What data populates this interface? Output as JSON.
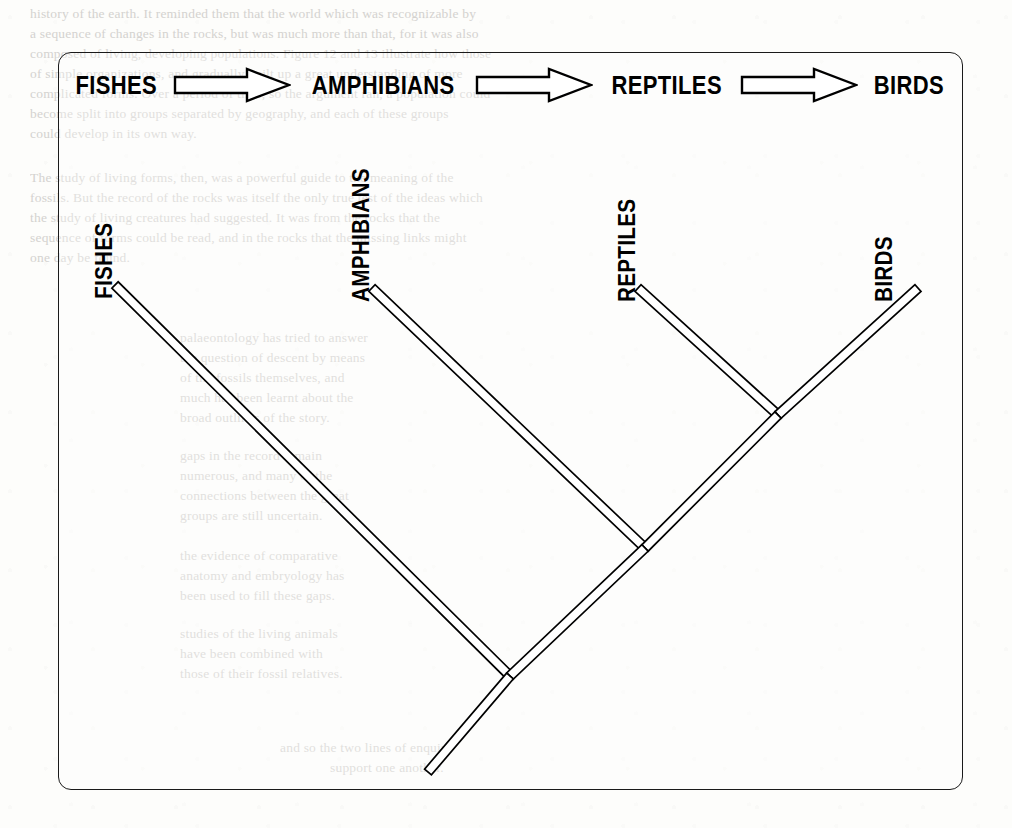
{
  "figure": {
    "type": "cladogram",
    "caption_visible": false,
    "border_color": "#1a1a1a",
    "ink_color": "#000000",
    "page_color": "#fdfdfb"
  },
  "sequence_row": {
    "items": [
      {
        "label": "FISHES",
        "kind": "text"
      },
      {
        "label": "arrow-right-1",
        "kind": "arrow"
      },
      {
        "label": "AMPHIBIANS",
        "kind": "text"
      },
      {
        "label": "arrow-right-2",
        "kind": "arrow"
      },
      {
        "label": "REPTILES",
        "kind": "text"
      },
      {
        "label": "arrow-right-3",
        "kind": "arrow"
      },
      {
        "label": "BIRDS",
        "kind": "text"
      }
    ]
  },
  "tree": {
    "tips": [
      {
        "name": "FISHES",
        "tip_x": 115,
        "tip_y": 285,
        "label_x": 118,
        "label_y": 272
      },
      {
        "name": "AMPHIBIANS",
        "tip_x": 372,
        "tip_y": 288,
        "label_x": 375,
        "label_y": 275
      },
      {
        "name": "REPTILES",
        "tip_x": 638,
        "tip_y": 288,
        "label_x": 641,
        "label_y": 275
      },
      {
        "name": "BIRDS",
        "tip_x": 918,
        "tip_y": 288,
        "label_x": 898,
        "label_y": 275
      }
    ],
    "nodes": [
      {
        "name": "reptiles-birds-node",
        "x": 778,
        "y": 415
      },
      {
        "name": "amphibians-node",
        "x": 645,
        "y": 548
      },
      {
        "name": "fishes-root-node",
        "x": 510,
        "y": 676
      },
      {
        "name": "root-stem-end",
        "x": 428,
        "y": 772
      }
    ],
    "branches": [
      {
        "name": "branch-fishes",
        "from": [
          115,
          285
        ],
        "to": [
          510,
          676
        ]
      },
      {
        "name": "branch-amphibians",
        "from": [
          372,
          288
        ],
        "to": [
          645,
          548
        ]
      },
      {
        "name": "branch-reptiles",
        "from": [
          638,
          288
        ],
        "to": [
          778,
          415
        ]
      },
      {
        "name": "branch-birds",
        "from": [
          918,
          288
        ],
        "to": [
          778,
          415
        ]
      },
      {
        "name": "branch-internal-upper",
        "from": [
          778,
          415
        ],
        "to": [
          645,
          548
        ]
      },
      {
        "name": "branch-internal-lower",
        "from": [
          645,
          548
        ],
        "to": [
          510,
          676
        ]
      },
      {
        "name": "branch-root-stem",
        "from": [
          510,
          676
        ],
        "to": [
          428,
          772
        ]
      }
    ],
    "branch_width": 9
  },
  "background_ghost_text": {
    "note": "faint show-through from reverse of scanned page",
    "lines": [
      {
        "x": 30,
        "y": 6,
        "text": "history of the earth. It reminded them that the world which was recognizable by"
      },
      {
        "x": 30,
        "y": 26,
        "text": "a sequence of changes in the rocks, but was much more than that, for it was also"
      },
      {
        "x": 30,
        "y": 46,
        "text": "composed of living, developing populations. Figure 12 and 13 illustrate how those"
      },
      {
        "x": 30,
        "y": 66,
        "text": "of simple organizations, and gradually built up a great understanding of more"
      },
      {
        "x": 30,
        "y": 86,
        "text": "complicated forms. Over a period of time, so the argument ran, a population could"
      },
      {
        "x": 30,
        "y": 106,
        "text": "become split into groups separated by geography, and each of these groups"
      },
      {
        "x": 30,
        "y": 126,
        "text": "could develop in its own way."
      },
      {
        "x": 30,
        "y": 170,
        "text": "The study of living forms, then, was a powerful guide to the meaning of the"
      },
      {
        "x": 30,
        "y": 190,
        "text": "fossils. But the record of the rocks was itself the only true test of the ideas which"
      },
      {
        "x": 30,
        "y": 210,
        "text": "the study of living creatures had suggested. It was from the rocks that the"
      },
      {
        "x": 30,
        "y": 230,
        "text": "sequence of forms could be read, and in the rocks that the missing links might"
      },
      {
        "x": 30,
        "y": 250,
        "text": "one day be found."
      },
      {
        "x": 180,
        "y": 330,
        "text": "palaeontology has tried to answer"
      },
      {
        "x": 180,
        "y": 350,
        "text": "the question of descent by means"
      },
      {
        "x": 180,
        "y": 370,
        "text": "of the fossils themselves, and"
      },
      {
        "x": 180,
        "y": 390,
        "text": "much has been learnt about the"
      },
      {
        "x": 180,
        "y": 410,
        "text": "broad outlines of the story."
      },
      {
        "x": 180,
        "y": 448,
        "text": "gaps in the record remain"
      },
      {
        "x": 180,
        "y": 468,
        "text": "numerous, and many of the"
      },
      {
        "x": 180,
        "y": 488,
        "text": "connections between the great"
      },
      {
        "x": 180,
        "y": 508,
        "text": "groups are still uncertain."
      },
      {
        "x": 180,
        "y": 548,
        "text": "the evidence of comparative"
      },
      {
        "x": 180,
        "y": 568,
        "text": "anatomy and embryology has"
      },
      {
        "x": 180,
        "y": 588,
        "text": "been used to fill these gaps."
      },
      {
        "x": 180,
        "y": 626,
        "text": "studies of the living animals"
      },
      {
        "x": 180,
        "y": 646,
        "text": "have been combined with"
      },
      {
        "x": 180,
        "y": 666,
        "text": "those of their fossil relatives."
      },
      {
        "x": 280,
        "y": 740,
        "text": "and so the two lines of enquiry"
      },
      {
        "x": 330,
        "y": 760,
        "text": "support one another."
      },
      {
        "x": 60,
        "y": 806,
        "text": ""
      }
    ]
  }
}
